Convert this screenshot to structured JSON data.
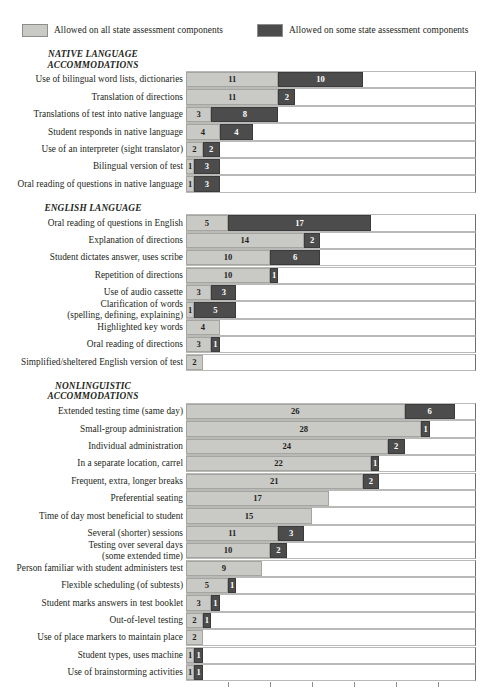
{
  "legend": {
    "entries": [
      {
        "label": "Allowed on all state assessment components",
        "color": "#c9c9c6",
        "key": "all"
      },
      {
        "label": "Allowed on some state assessment components",
        "color": "#4c4c4c",
        "key": "some"
      }
    ]
  },
  "chart_data": {
    "type": "bar",
    "orientation": "horizontal",
    "stacked": true,
    "title": "",
    "xlabel": "",
    "ylabel": "",
    "xlim": [
      0,
      34.5
    ],
    "xticks": [
      0,
      5,
      10,
      15,
      20,
      25,
      30
    ],
    "grid": false,
    "legend_position": "top",
    "series": [
      {
        "name": "Allowed on all state assessment components",
        "color": "#c9c9c6"
      },
      {
        "name": "Allowed on some state assessment components",
        "color": "#4c4c4c"
      }
    ],
    "sections": [
      {
        "heading": "NATIVE LANGUAGE\nACCOMMODATIONS",
        "heading_line1": "NATIVE LANGUAGE",
        "heading_line2": "ACCOMMODATIONS",
        "categories": [
          "Use of bilingual word lists, dictionaries",
          "Translation of directions",
          "Translations of test into native language",
          "Student responds in native language",
          "Use of an interpreter (sight translator)",
          "Bilingual version of test",
          "Oral reading of questions in native language"
        ],
        "all": [
          11,
          11,
          3,
          4,
          2,
          1,
          1
        ],
        "some": [
          10,
          2,
          8,
          4,
          2,
          3,
          3
        ]
      },
      {
        "heading": "ENGLISH LANGUAGE",
        "heading_line1": "ENGLISH LANGUAGE",
        "heading_line2": "",
        "categories": [
          "Oral reading of questions in English",
          "Explanation of directions",
          "Student dictates answer, uses scribe",
          "Repetition of directions",
          "Use of audio cassette",
          "Clarification of words\n(spelling, defining, explaining)",
          "Highlighted key words",
          "Oral reading of directions",
          "Simplified/sheltered English version of test"
        ],
        "all": [
          5,
          14,
          10,
          10,
          3,
          1,
          4,
          3,
          2
        ],
        "some": [
          17,
          2,
          6,
          1,
          3,
          5,
          0,
          1,
          0
        ]
      },
      {
        "heading": "NONLINGUISTIC\nACCOMMODATIONS",
        "heading_line1": "NONLINGUISTIC",
        "heading_line2": "ACCOMMODATIONS",
        "categories": [
          "Extended testing time (same day)",
          "Small-group administration",
          "Individual administration",
          "In a separate location, carrel",
          "Frequent, extra, longer breaks",
          "Preferential seating",
          "Time of day most beneficial to student",
          "Several (shorter) sessions",
          "Testing over several days\n(some extended time)",
          "Person familiar with student administers test",
          "Flexible scheduling (of subtests)",
          "Student marks answers in test booklet",
          "Out-of-level testing",
          "Use of place markers to maintain place",
          "Student types, uses machine",
          "Use of brainstorming activities"
        ],
        "all": [
          26,
          28,
          24,
          22,
          21,
          17,
          15,
          11,
          10,
          9,
          5,
          3,
          2,
          2,
          1,
          1
        ],
        "some": [
          6,
          1,
          2,
          1,
          2,
          0,
          0,
          3,
          2,
          0,
          1,
          1,
          1,
          0,
          1,
          1
        ]
      }
    ]
  }
}
